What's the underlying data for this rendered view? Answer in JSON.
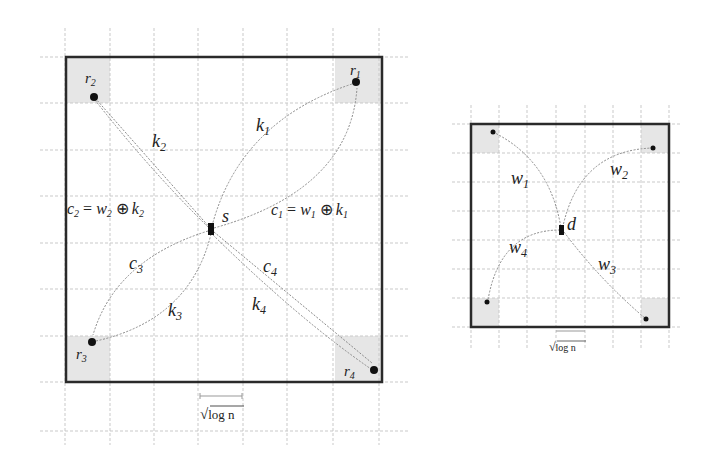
{
  "left_diagram": {
    "source_label": "s",
    "relay_labels": [
      "r1",
      "r2",
      "r3",
      "r4"
    ],
    "path_labels": {
      "k1": "k",
      "k1_sub": "1",
      "k2": "k",
      "k2_sub": "2",
      "k3": "k",
      "k3_sub": "3",
      "k4": "k",
      "k4_sub": "4",
      "c3": "c",
      "c3_sub": "3",
      "c4": "c",
      "c4_sub": "4"
    },
    "equation_left": {
      "c": "c",
      "c_sub": "2",
      "eq": "=",
      "w": "w",
      "w_sub": "2",
      "xor": "⊕",
      "k": "k",
      "k_sub": "2"
    },
    "equation_right": {
      "c": "c",
      "c_sub": "1",
      "eq": "=",
      "w": "w",
      "w_sub": "1",
      "xor": "⊕",
      "k": "k",
      "k_sub": "1"
    },
    "scale_label": {
      "root": "√",
      "text": "log n"
    }
  },
  "right_diagram": {
    "dest_label": "d",
    "path_labels": [
      {
        "name": "w",
        "sub": "1"
      },
      {
        "name": "w",
        "sub": "2"
      },
      {
        "name": "w",
        "sub": "3"
      },
      {
        "name": "w",
        "sub": "4"
      }
    ],
    "scale_label": {
      "root": "√",
      "text": "log n"
    }
  },
  "colors": {
    "frame": "#2a2a2a",
    "grid": "#c9c9c9",
    "corner_shade": "#e6e6e6",
    "path": "#8a8a8a"
  }
}
